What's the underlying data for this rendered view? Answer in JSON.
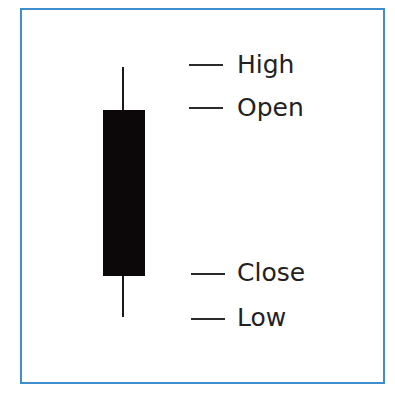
{
  "diagram": {
    "border_color": "#3f8fcf",
    "candle_color": "#0c0708",
    "labels": {
      "high": "High",
      "open": "Open",
      "close": "Close",
      "low": "Low"
    }
  }
}
